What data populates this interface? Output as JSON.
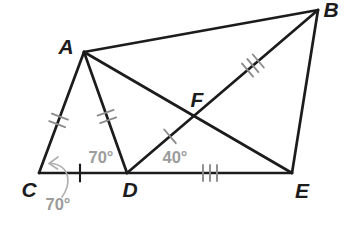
{
  "figure": {
    "colors": {
      "background": "#ffffff",
      "line": "#1c1c1c",
      "tick": "#8c8c8c",
      "angle_label": "#9c9c9c",
      "vertex_label": "#1c1c1c"
    },
    "vertices": {
      "A": "A",
      "B": "B",
      "C": "C",
      "D": "D",
      "E": "E",
      "F": "F"
    },
    "angle_labels": {
      "acd_outside": "70°",
      "adc": "70°",
      "fde": "40°"
    },
    "congruence_marks": [
      {
        "segment": "CA",
        "tick_count": 2
      },
      {
        "segment": "AD",
        "tick_count": 2
      },
      {
        "segment": "CD",
        "tick_count": 1
      },
      {
        "segment": "DF",
        "tick_count": 1
      },
      {
        "segment": "DE",
        "tick_count": 3
      },
      {
        "segment": "FB",
        "tick_count": 3
      }
    ],
    "plain_segments": [
      "AB",
      "BE",
      "AF",
      "FE"
    ]
  }
}
